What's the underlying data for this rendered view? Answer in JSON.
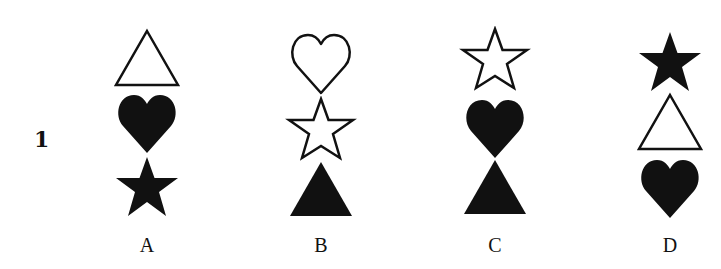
{
  "question": {
    "number": "1"
  },
  "colors": {
    "fill": "#111111",
    "outline": "#111111",
    "background": "#ffffff"
  },
  "options": [
    {
      "label": "A",
      "shapes": [
        {
          "type": "triangle",
          "style": "outline"
        },
        {
          "type": "heart",
          "style": "filled"
        },
        {
          "type": "star",
          "style": "filled"
        }
      ]
    },
    {
      "label": "B",
      "shapes": [
        {
          "type": "heart",
          "style": "outline"
        },
        {
          "type": "star",
          "style": "outline"
        },
        {
          "type": "triangle",
          "style": "filled"
        }
      ]
    },
    {
      "label": "C",
      "shapes": [
        {
          "type": "star",
          "style": "outline"
        },
        {
          "type": "heart",
          "style": "filled"
        },
        {
          "type": "triangle",
          "style": "filled"
        }
      ]
    },
    {
      "label": "D",
      "shapes": [
        {
          "type": "star",
          "style": "filled"
        },
        {
          "type": "triangle",
          "style": "outline"
        },
        {
          "type": "heart",
          "style": "filled"
        }
      ]
    }
  ]
}
